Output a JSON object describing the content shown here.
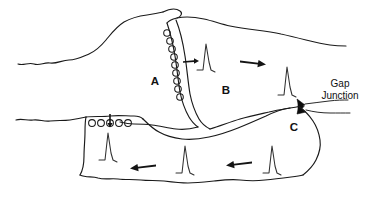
{
  "figure": {
    "kind": "hand-drawn-biology-diagram",
    "background_color": "#ffffff",
    "ink_color": "#1a1a1a"
  },
  "labels": {
    "region_a": "A",
    "region_b": "B",
    "region_c": "C",
    "gap_junction_line1": "Gap",
    "gap_junction_line2": "Junction"
  },
  "regions": [
    {
      "id": "a",
      "letter": "A",
      "role": "presynaptic-cell",
      "letter_x": 155,
      "letter_y": 82
    },
    {
      "id": "b",
      "letter": "B",
      "role": "postsynaptic-cell",
      "letter_x": 226,
      "letter_y": 91
    },
    {
      "id": "c",
      "letter": "C",
      "role": "coupled-cell",
      "letter_x": 294,
      "letter_y": 128
    }
  ],
  "callouts": [
    {
      "id": "gap-junction",
      "line1": "Gap",
      "line2": "Junction",
      "x": 340,
      "y1": 84,
      "y2": 96
    }
  ],
  "vesicle_groups": [
    {
      "id": "synaptic-cleft-vesicles",
      "count": 9,
      "orientation": "vertical-arc",
      "radius": 3.3
    },
    {
      "id": "lower-cell-vesicles",
      "count": 5,
      "orientation": "horizontal-row",
      "radius": 3.4
    }
  ],
  "spikes": [
    {
      "id": "spike-cell-b-left",
      "x": 206,
      "y": 55,
      "label": "action-potential"
    },
    {
      "id": "spike-cell-b-right",
      "x": 287,
      "y": 78,
      "label": "action-potential"
    },
    {
      "id": "spike-cell-lower-left",
      "x": 108,
      "y": 145,
      "label": "action-potential"
    },
    {
      "id": "spike-cell-lower-mid",
      "x": 185,
      "y": 158,
      "label": "action-potential"
    },
    {
      "id": "spike-cell-c",
      "x": 272,
      "y": 158,
      "label": "action-potential"
    }
  ],
  "arrows": [
    {
      "id": "arrow-cleft-release",
      "direction": "right",
      "x": 190,
      "y": 62,
      "size": "small"
    },
    {
      "id": "arrow-cell-b-propagation",
      "direction": "right",
      "x": 253,
      "y": 63,
      "size": "medium"
    },
    {
      "id": "arrow-lower-vesicle-release",
      "direction": "down",
      "x": 110,
      "y": 118,
      "size": "small"
    },
    {
      "id": "arrow-lower-left-propagation",
      "direction": "left",
      "x": 144,
      "y": 167,
      "size": "medium"
    },
    {
      "id": "arrow-lower-right-propagation",
      "direction": "left",
      "x": 240,
      "y": 164,
      "size": "medium"
    }
  ]
}
